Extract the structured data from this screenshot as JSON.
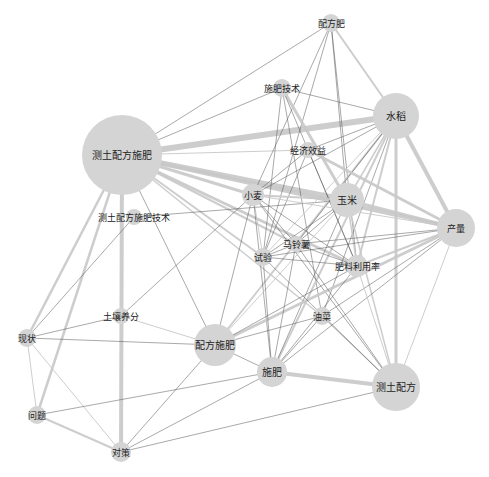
{
  "diagram": {
    "type": "keyword-co-occurrence-network",
    "nodes": [
      {
        "id": "cetu_peifang_shifei",
        "label": "测土配方施肥",
        "x": 122,
        "y": 155,
        "r": 40,
        "fs": 10
      },
      {
        "id": "peifangfei",
        "label": "配方肥",
        "x": 331,
        "y": 23,
        "r": 9,
        "fs": 9
      },
      {
        "id": "shifei_jishu",
        "label": "施肥技术",
        "x": 282,
        "y": 88,
        "r": 9,
        "fs": 9
      },
      {
        "id": "shuidao",
        "label": "水稻",
        "x": 396,
        "y": 116,
        "r": 23,
        "fs": 10
      },
      {
        "id": "jingji_xiaoyi",
        "label": "经济效益",
        "x": 308,
        "y": 150,
        "r": 8,
        "fs": 9
      },
      {
        "id": "xiaomai",
        "label": "小麦",
        "x": 253,
        "y": 195,
        "r": 11,
        "fs": 9
      },
      {
        "id": "yumi",
        "label": "玉米",
        "x": 347,
        "y": 200,
        "r": 17,
        "fs": 10
      },
      {
        "id": "chanliang",
        "label": "产量",
        "x": 456,
        "y": 228,
        "r": 19,
        "fs": 9
      },
      {
        "id": "cetu_jishu",
        "label": "测土配方施肥技术",
        "x": 134,
        "y": 217,
        "r": 8,
        "fs": 9
      },
      {
        "id": "malingshu",
        "label": "马铃薯",
        "x": 296,
        "y": 244,
        "r": 8,
        "fs": 9
      },
      {
        "id": "shiyan",
        "label": "试验",
        "x": 263,
        "y": 257,
        "r": 9,
        "fs": 9
      },
      {
        "id": "feiliao_liyonglv",
        "label": "肥料利用率",
        "x": 357,
        "y": 266,
        "r": 11,
        "fs": 9
      },
      {
        "id": "turang_yangfen",
        "label": "土壤养分",
        "x": 121,
        "y": 316,
        "r": 8,
        "fs": 9
      },
      {
        "id": "youcai",
        "label": "油菜",
        "x": 322,
        "y": 316,
        "r": 9,
        "fs": 9
      },
      {
        "id": "xianzhuang",
        "label": "现状",
        "x": 27,
        "y": 338,
        "r": 9,
        "fs": 9
      },
      {
        "id": "peifang_shifei",
        "label": "配方施肥",
        "x": 215,
        "y": 345,
        "r": 21,
        "fs": 10
      },
      {
        "id": "shifei",
        "label": "施肥",
        "x": 272,
        "y": 372,
        "r": 15,
        "fs": 10
      },
      {
        "id": "cetu_peifang",
        "label": "测土配方",
        "x": 396,
        "y": 387,
        "r": 24,
        "fs": 10
      },
      {
        "id": "wenti",
        "label": "问题",
        "x": 37,
        "y": 415,
        "r": 9,
        "fs": 9
      },
      {
        "id": "duice",
        "label": "对策",
        "x": 121,
        "y": 452,
        "r": 10,
        "fs": 9
      }
    ],
    "edges": [
      {
        "s": "cetu_peifang_shifei",
        "t": "shuidao",
        "w": 6
      },
      {
        "s": "cetu_peifang_shifei",
        "t": "yumi",
        "w": 5
      },
      {
        "s": "cetu_peifang_shifei",
        "t": "chanliang",
        "w": 4
      },
      {
        "s": "cetu_peifang_shifei",
        "t": "xiaomai",
        "w": 3
      },
      {
        "s": "cetu_peifang_shifei",
        "t": "feiliao_liyonglv",
        "w": 3
      },
      {
        "s": "cetu_peifang_shifei",
        "t": "peifangfei",
        "w": 0.6
      },
      {
        "s": "cetu_peifang_shifei",
        "t": "shifei_jishu",
        "w": 0.6
      },
      {
        "s": "cetu_peifang_shifei",
        "t": "jingji_xiaoyi",
        "w": 1
      },
      {
        "s": "cetu_peifang_shifei",
        "t": "duice",
        "w": 4
      },
      {
        "s": "cetu_peifang_shifei",
        "t": "xianzhuang",
        "w": 2.5
      },
      {
        "s": "cetu_peifang_shifei",
        "t": "wenti",
        "w": 2.5
      },
      {
        "s": "cetu_peifang_shifei",
        "t": "shiyan",
        "w": 2
      },
      {
        "s": "cetu_peifang_shifei",
        "t": "malingshu",
        "w": 2
      },
      {
        "s": "cetu_peifang_shifei",
        "t": "peifang_shifei",
        "w": 0.6
      },
      {
        "s": "cetu_peifang_shifei",
        "t": "youcai",
        "w": 1.5
      },
      {
        "s": "cetu_jishu",
        "t": "yumi",
        "w": 0.6
      },
      {
        "s": "cetu_jishu",
        "t": "xianzhuang",
        "w": 0.6
      },
      {
        "s": "peifangfei",
        "t": "shuidao",
        "w": 2
      },
      {
        "s": "peifangfei",
        "t": "xiaomai",
        "w": 0.6
      },
      {
        "s": "peifangfei",
        "t": "yumi",
        "w": 0.6
      },
      {
        "s": "peifangfei",
        "t": "shiyan",
        "w": 0.6
      },
      {
        "s": "peifangfei",
        "t": "feiliao_liyonglv",
        "w": 0.6
      },
      {
        "s": "shifei_jishu",
        "t": "shuidao",
        "w": 0.6
      },
      {
        "s": "shifei_jishu",
        "t": "yumi",
        "w": 3
      },
      {
        "s": "shifei_jishu",
        "t": "shiyan",
        "w": 0.6
      },
      {
        "s": "shifei_jishu",
        "t": "feiliao_liyonglv",
        "w": 0.6
      },
      {
        "s": "shifei_jishu",
        "t": "youcai",
        "w": 0.6
      },
      {
        "s": "shuidao",
        "t": "chanliang",
        "w": 4
      },
      {
        "s": "shuidao",
        "t": "jingji_xiaoyi",
        "w": 0.6
      },
      {
        "s": "shuidao",
        "t": "xiaomai",
        "w": 0.6
      },
      {
        "s": "shuidao",
        "t": "yumi",
        "w": 1.5
      },
      {
        "s": "shuidao",
        "t": "feiliao_liyonglv",
        "w": 2
      },
      {
        "s": "shuidao",
        "t": "cetu_peifang",
        "w": 3
      },
      {
        "s": "shuidao",
        "t": "shifei",
        "w": 2
      },
      {
        "s": "shuidao",
        "t": "peifang_shifei",
        "w": 2
      },
      {
        "s": "shuidao",
        "t": "shiyan",
        "w": 1
      },
      {
        "s": "shuidao",
        "t": "malingshu",
        "w": 0.6
      },
      {
        "s": "shuidao",
        "t": "youcai",
        "w": 0.6
      },
      {
        "s": "jingji_xiaoyi",
        "t": "chanliang",
        "w": 3
      },
      {
        "s": "jingji_xiaoyi",
        "t": "xiaomai",
        "w": 0.6
      },
      {
        "s": "jingji_xiaoyi",
        "t": "shiyan",
        "w": 0.6
      },
      {
        "s": "jingji_xiaoyi",
        "t": "feiliao_liyonglv",
        "w": 0.6
      },
      {
        "s": "xiaomai",
        "t": "yumi",
        "w": 2
      },
      {
        "s": "xiaomai",
        "t": "chanliang",
        "w": 1
      },
      {
        "s": "xiaomai",
        "t": "shiyan",
        "w": 1
      },
      {
        "s": "xiaomai",
        "t": "malingshu",
        "w": 0.6
      },
      {
        "s": "xiaomai",
        "t": "feiliao_liyonglv",
        "w": 0.6
      },
      {
        "s": "xiaomai",
        "t": "shifei",
        "w": 0.6
      },
      {
        "s": "xiaomai",
        "t": "cetu_peifang",
        "w": 0.6
      },
      {
        "s": "xiaomai",
        "t": "peifang_shifei",
        "w": 0.6
      },
      {
        "s": "yumi",
        "t": "chanliang",
        "w": 3
      },
      {
        "s": "yumi",
        "t": "feiliao_liyonglv",
        "w": 1.5
      },
      {
        "s": "yumi",
        "t": "malingshu",
        "w": 0.6
      },
      {
        "s": "yumi",
        "t": "shiyan",
        "w": 0.6
      },
      {
        "s": "yumi",
        "t": "shifei",
        "w": 0.6
      },
      {
        "s": "yumi",
        "t": "cetu_peifang",
        "w": 1.5
      },
      {
        "s": "yumi",
        "t": "peifang_shifei",
        "w": 1
      },
      {
        "s": "chanliang",
        "t": "feiliao_liyonglv",
        "w": 2
      },
      {
        "s": "chanliang",
        "t": "peifang_shifei",
        "w": 3
      },
      {
        "s": "chanliang",
        "t": "cetu_peifang",
        "w": 1
      },
      {
        "s": "chanliang",
        "t": "shiyan",
        "w": 0.6
      },
      {
        "s": "chanliang",
        "t": "malingshu",
        "w": 0.6
      },
      {
        "s": "chanliang",
        "t": "youcai",
        "w": 0.6
      },
      {
        "s": "chanliang",
        "t": "shifei",
        "w": 0.6
      },
      {
        "s": "malingshu",
        "t": "shiyan",
        "w": 0.6
      },
      {
        "s": "malingshu",
        "t": "feiliao_liyonglv",
        "w": 0.6
      },
      {
        "s": "malingshu",
        "t": "cetu_peifang",
        "w": 0.6
      },
      {
        "s": "malingshu",
        "t": "shifei",
        "w": 0.6
      },
      {
        "s": "shiyan",
        "t": "feiliao_liyonglv",
        "w": 0.6
      },
      {
        "s": "shiyan",
        "t": "shifei",
        "w": 0.6
      },
      {
        "s": "shiyan",
        "t": "cetu_peifang",
        "w": 0.6
      },
      {
        "s": "feiliao_liyonglv",
        "t": "cetu_peifang",
        "w": 1
      },
      {
        "s": "feiliao_liyonglv",
        "t": "shifei",
        "w": 0.6
      },
      {
        "s": "feiliao_liyonglv",
        "t": "peifang_shifei",
        "w": 0.6
      },
      {
        "s": "youcai",
        "t": "shifei",
        "w": 0.6
      },
      {
        "s": "youcai",
        "t": "cetu_peifang",
        "w": 0.6
      },
      {
        "s": "youcai",
        "t": "peifang_shifei",
        "w": 0.6
      },
      {
        "s": "turang_yangfen",
        "t": "peifang_shifei",
        "w": 1
      },
      {
        "s": "turang_yangfen",
        "t": "xianzhuang",
        "w": 0.6
      },
      {
        "s": "turang_yangfen",
        "t": "xiaomai",
        "w": 0.6
      },
      {
        "s": "xianzhuang",
        "t": "peifang_shifei",
        "w": 0.6
      },
      {
        "s": "xianzhuang",
        "t": "wenti",
        "w": 1
      },
      {
        "s": "xianzhuang",
        "t": "duice",
        "w": 1
      },
      {
        "s": "wenti",
        "t": "duice",
        "w": 2
      },
      {
        "s": "wenti",
        "t": "shifei",
        "w": 0.6
      },
      {
        "s": "duice",
        "t": "peifang_shifei",
        "w": 0.6
      },
      {
        "s": "duice",
        "t": "shifei",
        "w": 0.6
      },
      {
        "s": "duice",
        "t": "cetu_peifang",
        "w": 0.6
      },
      {
        "s": "peifang_shifei",
        "t": "shifei",
        "w": 0.6
      },
      {
        "s": "shifei",
        "t": "cetu_peifang",
        "w": 4
      }
    ]
  }
}
